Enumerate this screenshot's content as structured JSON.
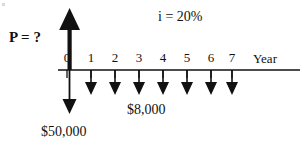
{
  "diagram": {
    "type": "cash-flow-timeline",
    "background_color": "#ffffff",
    "ink_color": "#111111",
    "labels": {
      "present_value": "P = ?",
      "interest_rate": "i = 20%",
      "annual_payment": "$8,000",
      "principal": "$50,000",
      "axis_label": "Year"
    },
    "axis": {
      "ticks": [
        "0",
        "1",
        "2",
        "3",
        "4",
        "5",
        "6",
        "7"
      ],
      "tick_x": [
        67,
        91,
        115,
        139,
        163,
        187,
        211,
        232
      ],
      "baseline_y": 70,
      "baseline_x_start": 58,
      "baseline_x_end": 300
    },
    "arrows": {
      "up_arrow_period": "0",
      "up_arrow_label": "P = ?",
      "down_arrow_period_0_label": "$50,000",
      "payment_periods": [
        "1",
        "2",
        "3",
        "4",
        "5",
        "6",
        "7"
      ],
      "payment_label": "$8,000"
    }
  }
}
